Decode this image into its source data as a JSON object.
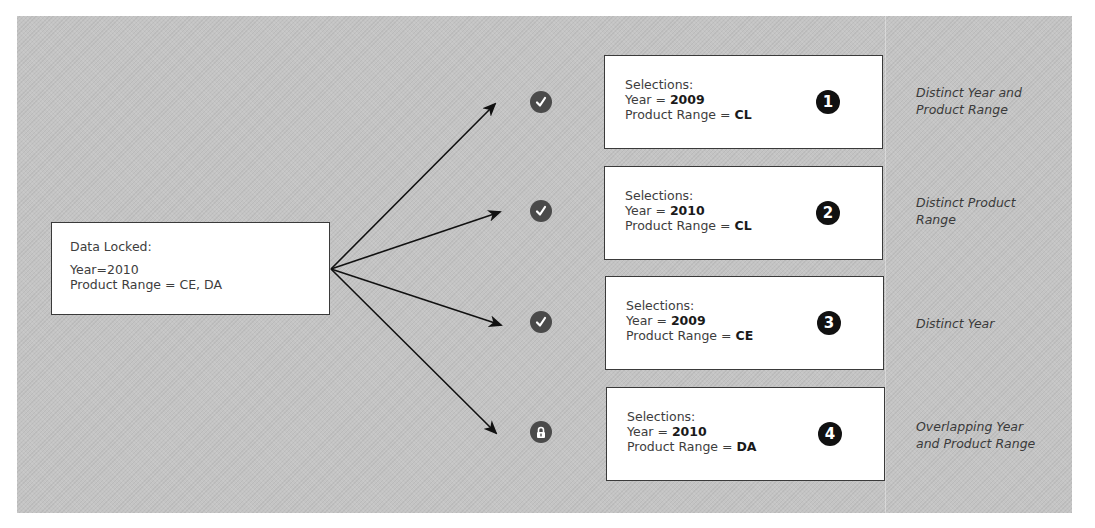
{
  "diagram": {
    "type": "flow",
    "source": {
      "title": "Data Locked:",
      "lines": [
        "Year=2010",
        "Product Range = CE, DA"
      ]
    },
    "branches": [
      {
        "number": "1",
        "status": "check",
        "status_icon": "check-circle-icon",
        "heading": "Selections:",
        "year_label": "Year = ",
        "year_value": "2009",
        "range_label": "Product Range = ",
        "range_value": "CL",
        "description": [
          "Distinct Year and",
          "Product Range"
        ]
      },
      {
        "number": "2",
        "status": "check",
        "status_icon": "check-circle-icon",
        "heading": "Selections:",
        "year_label": "Year = ",
        "year_value": "2010",
        "range_label": "Product Range = ",
        "range_value": "CL",
        "description": [
          "Distinct Product",
          "Range"
        ]
      },
      {
        "number": "3",
        "status": "check",
        "status_icon": "check-circle-icon",
        "heading": "Selections:",
        "year_label": "Year = ",
        "year_value": "2009",
        "range_label": "Product Range = ",
        "range_value": "CE",
        "description": [
          "Distinct Year",
          ""
        ]
      },
      {
        "number": "4",
        "status": "locked",
        "status_icon": "lock-circle-icon",
        "heading": "Selections:",
        "year_label": "Year = ",
        "year_value": "2010",
        "range_label": "Product Range = ",
        "range_value": "DA",
        "description": [
          "Overlapping Year",
          "and Product Range"
        ]
      }
    ],
    "colors": {
      "background": "#c4c4c4",
      "box": "#ffffff",
      "border": "#3a3a3a",
      "badge": "#111111",
      "status_icon": "#4a4a4a"
    }
  }
}
